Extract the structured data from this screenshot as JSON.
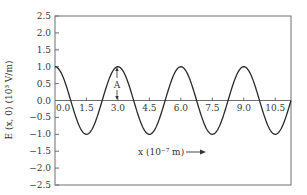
{
  "chart_data": {
    "type": "line",
    "title": "",
    "xlabel": "x (10⁻⁷ m)",
    "ylabel": "E (x, 0) (10³ V/m)",
    "xlim": [
      0,
      11.25
    ],
    "ylim": [
      -2.5,
      2.5
    ],
    "grid": false,
    "legend": null,
    "x_ticks": [
      "0.0",
      "1.5",
      "3.0",
      "4.5",
      "6.0",
      "7.5",
      "9.0",
      "10.5"
    ],
    "x_tick_values": [
      0,
      1.5,
      3.0,
      4.5,
      6.0,
      7.5,
      9.0,
      10.5
    ],
    "y_ticks": [
      "2.5",
      "2.0",
      "1.5",
      "1.0",
      "0.5",
      "0.0",
      "−0.5",
      "−1.0",
      "−1.5",
      "−2.0",
      "−2.5"
    ],
    "y_tick_values": [
      2.5,
      2.0,
      1.5,
      1.0,
      0.5,
      0.0,
      -0.5,
      -1.0,
      -1.5,
      -2.0,
      -2.5
    ],
    "series": [
      {
        "name": "E(x,0) = A cos(2πx/λ)",
        "function": "cosine",
        "amplitude": 1.0,
        "wavelength": 3.0,
        "x": [
          0,
          0.75,
          1.5,
          2.25,
          3.0,
          3.75,
          4.5,
          5.25,
          6.0,
          6.75,
          7.5,
          8.25,
          9.0,
          9.75,
          10.5,
          11.25
        ],
        "values": [
          1.0,
          0.0,
          -1.0,
          0.0,
          1.0,
          0.0,
          -1.0,
          0.0,
          1.0,
          0.0,
          -1.0,
          0.0,
          1.0,
          0.0,
          -1.0,
          0.0
        ]
      }
    ],
    "annotations": [
      {
        "text": "A",
        "x": 3.0,
        "y": 0.5,
        "description": "double arrow marking amplitude from axis to peak"
      }
    ],
    "xlabel_arrow": "→"
  },
  "labels": {
    "annotation_a": "A",
    "xlabel": "x (10⁻⁷ m)",
    "ylabel": "E (x, 0) (10³ V/m)"
  }
}
